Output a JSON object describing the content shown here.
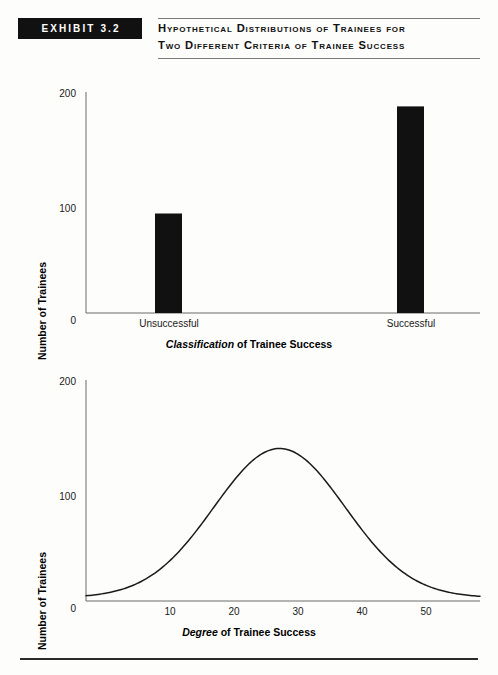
{
  "header": {
    "exhibit_label": "EXHIBIT 3.2",
    "title_line1": "Hypothetical Distributions of Trainees for",
    "title_line2": "Two Different Criteria of Trainee Success"
  },
  "colors": {
    "bar_fill": "#111111",
    "axis": "#6b6b6b",
    "curve": "#1a1a1a",
    "rule": "#2b2b2b",
    "background": "#fdfdfb"
  },
  "chart_data": [
    {
      "type": "bar",
      "title": "",
      "categories": [
        "Unsuccessful",
        "Successful"
      ],
      "values": [
        90,
        187
      ],
      "xlabel_em": "Classification",
      "xlabel_rest": " of Trainee Success",
      "ylabel": "Number of Trainees",
      "ytick_labels": [
        "0",
        "100",
        "200"
      ],
      "ytick_values": [
        0,
        100,
        200
      ],
      "ylim": [
        0,
        200
      ],
      "grid": false,
      "legend": "none"
    },
    {
      "type": "line",
      "title": "",
      "xlabel_em": "Degree",
      "xlabel_rest": " of Trainee Success",
      "ylabel": "Number of Trainees",
      "ytick_labels": [
        "0",
        "100",
        "200"
      ],
      "ytick_values": [
        0,
        100,
        200
      ],
      "ylim": [
        0,
        200
      ],
      "xtick_labels": [
        "10",
        "20",
        "30",
        "40",
        "50"
      ],
      "xtick_values": [
        10,
        20,
        30,
        40,
        50
      ],
      "xlim": [
        1,
        58
      ],
      "grid": false,
      "legend": "none",
      "curve": {
        "shape": "normal-distribution",
        "peak_x": 29,
        "peak_y": 135,
        "sigma": 9.5
      },
      "x": [
        1,
        4,
        7,
        10,
        13,
        16,
        19,
        22,
        25,
        28,
        29,
        31,
        34,
        37,
        40,
        43,
        46,
        49,
        52,
        55,
        58
      ],
      "y": [
        4,
        6,
        10,
        16,
        26,
        40,
        60,
        84,
        109,
        130,
        135,
        132,
        117,
        95,
        70,
        48,
        30,
        17,
        9,
        5,
        4
      ]
    }
  ]
}
